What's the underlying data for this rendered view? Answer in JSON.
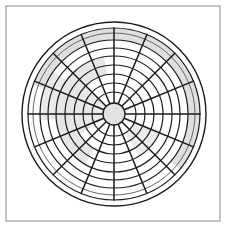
{
  "figure": {
    "title": "Polar Grid Diagram",
    "background_color": "#ffffff",
    "width": 227,
    "height": 228
  },
  "frame": {
    "name": "outer-border-frame",
    "x": 6,
    "y": 6,
    "width": 214,
    "height": 215,
    "stroke": "#9b9b9b",
    "stroke_width": 1.2,
    "fill": "#ffffff"
  },
  "chart_data": {
    "type": "polar-grid",
    "title": "Polar Grid Diagram",
    "subtitle": "",
    "xlabel": "",
    "ylabel": "",
    "center": {
      "cx": 114,
      "cy": 114
    },
    "grid": true,
    "legend": "none",
    "hub": {
      "label": "center-hub",
      "radius": 11,
      "fill": "#e2e2e2",
      "stroke": "#1a1a1a",
      "stroke_width": 1.3
    },
    "radial_axis": {
      "min": 0,
      "max": 92,
      "tick_labels": [],
      "rings": [
        {
          "index": 1,
          "radius": 22,
          "stroke": "#1a1a1a",
          "stroke_width": 1.2
        },
        {
          "index": 2,
          "radius": 31,
          "stroke": "#1a1a1a",
          "stroke_width": 1.2
        },
        {
          "index": 3,
          "radius": 40,
          "stroke": "#1a1a1a",
          "stroke_width": 1.2
        },
        {
          "index": 4,
          "radius": 49,
          "stroke": "#1a1a1a",
          "stroke_width": 1.2
        },
        {
          "index": 5,
          "radius": 58,
          "stroke": "#1a1a1a",
          "stroke_width": 1.2
        },
        {
          "index": 6,
          "radius": 66,
          "stroke": "#1a1a1a",
          "stroke_width": 1.2
        },
        {
          "index": 7,
          "radius": 74,
          "stroke": "#1a1a1a",
          "stroke_width": 1.2
        },
        {
          "index": 8,
          "radius": 81,
          "stroke": "#666666",
          "stroke_width": 1.0
        },
        {
          "index": 9,
          "radius": 86,
          "stroke": "#1a1a1a",
          "stroke_width": 1.2
        },
        {
          "index": 10,
          "radius": 92,
          "stroke": "#1a1a1a",
          "stroke_width": 1.4
        }
      ]
    },
    "angular_axis": {
      "spoke_count": 16,
      "spoke_step_degrees": 22.5,
      "tick_labels": [],
      "spokes": [
        {
          "index": 0,
          "angle_deg": 0,
          "inner_radius": 11,
          "outer_radius": 86
        },
        {
          "index": 1,
          "angle_deg": 22.5,
          "inner_radius": 11,
          "outer_radius": 86
        },
        {
          "index": 2,
          "angle_deg": 45,
          "inner_radius": 11,
          "outer_radius": 86
        },
        {
          "index": 3,
          "angle_deg": 67.5,
          "inner_radius": 11,
          "outer_radius": 86
        },
        {
          "index": 4,
          "angle_deg": 90,
          "inner_radius": 11,
          "outer_radius": 86
        },
        {
          "index": 5,
          "angle_deg": 112.5,
          "inner_radius": 11,
          "outer_radius": 86
        },
        {
          "index": 6,
          "angle_deg": 135,
          "inner_radius": 11,
          "outer_radius": 86
        },
        {
          "index": 7,
          "angle_deg": 157.5,
          "inner_radius": 11,
          "outer_radius": 86
        },
        {
          "index": 8,
          "angle_deg": 180,
          "inner_radius": 11,
          "outer_radius": 86
        },
        {
          "index": 9,
          "angle_deg": 202.5,
          "inner_radius": 11,
          "outer_radius": 86
        },
        {
          "index": 10,
          "angle_deg": 225,
          "inner_radius": 11,
          "outer_radius": 86
        },
        {
          "index": 11,
          "angle_deg": 247.5,
          "inner_radius": 11,
          "outer_radius": 86
        },
        {
          "index": 12,
          "angle_deg": 270,
          "inner_radius": 11,
          "outer_radius": 86
        },
        {
          "index": 13,
          "angle_deg": 292.5,
          "inner_radius": 11,
          "outer_radius": 86
        },
        {
          "index": 14,
          "angle_deg": 315,
          "inner_radius": 11,
          "outer_radius": 86
        },
        {
          "index": 15,
          "angle_deg": 337.5,
          "inner_radius": 11,
          "outer_radius": 86
        }
      ]
    },
    "shaded_regions": [
      {
        "name": "outer-shaded-annulus",
        "kind": "annulus-arc",
        "inner_radius": 74,
        "outer_radius": 86,
        "start_angle_deg": 200,
        "end_angle_deg": 400,
        "fill": "#d9d9d9",
        "opacity": 0.85
      },
      {
        "name": "mid-shaded-annulus",
        "kind": "annulus-arc",
        "inner_radius": 40,
        "outer_radius": 58,
        "start_angle_deg": 120,
        "end_angle_deg": 260,
        "fill": "#e0e0e0",
        "opacity": 0.8
      },
      {
        "name": "inner-shaded-sector",
        "kind": "annulus-arc",
        "inner_radius": 11,
        "outer_radius": 40,
        "start_angle_deg": 150,
        "end_angle_deg": 225,
        "fill": "#e4e4e4",
        "opacity": 0.85
      },
      {
        "name": "lower-right-shaded-sector",
        "kind": "annulus-arc",
        "inner_radius": 22,
        "outer_radius": 49,
        "start_angle_deg": 20,
        "end_angle_deg": 60,
        "fill": "#e6e6e6",
        "opacity": 0.8
      },
      {
        "name": "upper-left-shaded-sector",
        "kind": "annulus-arc",
        "inner_radius": 58,
        "outer_radius": 74,
        "start_angle_deg": 175,
        "end_angle_deg": 215,
        "fill": "#e3e3e3",
        "opacity": 0.8
      }
    ],
    "colors": {
      "stroke_dark": "#1a1a1a",
      "stroke_mid": "#666666",
      "frame": "#9b9b9b",
      "shade_light": "#e4e4e4",
      "shade_mid": "#d9d9d9",
      "hub_fill": "#e2e2e2",
      "background": "#ffffff"
    }
  }
}
